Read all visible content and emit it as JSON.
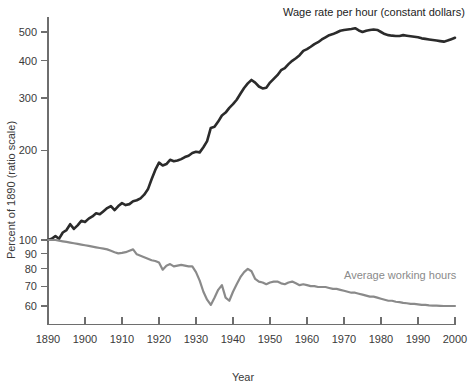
{
  "chart_data": {
    "type": "line",
    "title": "",
    "xlabel": "Year",
    "ylabel": "Percent of 1890 (ratio scale)",
    "scale": "log",
    "grid": false,
    "legend_position": "inline-annotations",
    "xlim": [
      1890,
      2000
    ],
    "ylim": [
      52,
      560
    ],
    "xticks": [
      1890,
      1900,
      1910,
      1920,
      1930,
      1940,
      1950,
      1960,
      1970,
      1980,
      1990,
      2000
    ],
    "xticklabels": [
      "1890",
      "1900",
      "1910",
      "1920",
      "1930",
      "1940",
      "1950",
      "1960",
      "1970",
      "1980",
      "1990",
      "2000"
    ],
    "yticks": [
      60,
      70,
      80,
      90,
      100,
      200,
      300,
      400,
      500
    ],
    "yticklabels": [
      "60",
      "70",
      "80",
      "90",
      "100",
      "200",
      "300",
      "400",
      "500"
    ],
    "colors": {
      "wage_rate": "#2b2b2b",
      "working_hours": "#8a8a8a",
      "axis": "#6e6e6e",
      "background": "#ffffff"
    },
    "series": [
      {
        "name": "Wage rate per hour (constant dollars)",
        "color": "#2b2b2b",
        "stroke_width": 2.6,
        "annotation": "Wage rate per hour (constant dollars)",
        "x": [
          1890,
          1891,
          1892,
          1893,
          1894,
          1895,
          1896,
          1897,
          1898,
          1899,
          1900,
          1901,
          1902,
          1903,
          1904,
          1905,
          1906,
          1907,
          1908,
          1909,
          1910,
          1911,
          1912,
          1913,
          1914,
          1915,
          1916,
          1917,
          1918,
          1919,
          1920,
          1921,
          1922,
          1923,
          1924,
          1925,
          1926,
          1927,
          1928,
          1929,
          1930,
          1931,
          1932,
          1933,
          1934,
          1935,
          1936,
          1937,
          1938,
          1939,
          1940,
          1941,
          1942,
          1943,
          1944,
          1945,
          1946,
          1947,
          1948,
          1949,
          1950,
          1951,
          1952,
          1953,
          1954,
          1955,
          1956,
          1957,
          1958,
          1959,
          1960,
          1961,
          1962,
          1963,
          1964,
          1965,
          1966,
          1967,
          1968,
          1969,
          1970,
          1971,
          1972,
          1973,
          1974,
          1975,
          1976,
          1977,
          1978,
          1979,
          1980,
          1981,
          1982,
          1983,
          1984,
          1985,
          1986,
          1987,
          1988,
          1989,
          1990,
          1991,
          1992,
          1993,
          1994,
          1995,
          1996,
          1997,
          1998,
          1999,
          2000
        ],
        "y": [
          100,
          101,
          103,
          101,
          106,
          108,
          113,
          109,
          112,
          116,
          115,
          118,
          120,
          123,
          122,
          125,
          128,
          130,
          126,
          130,
          133,
          131,
          132,
          135,
          136,
          138,
          142,
          148,
          160,
          172,
          182,
          178,
          180,
          186,
          184,
          185,
          187,
          190,
          192,
          196,
          198,
          197,
          205,
          215,
          238,
          240,
          250,
          262,
          268,
          278,
          286,
          296,
          310,
          324,
          336,
          345,
          338,
          328,
          323,
          325,
          338,
          348,
          358,
          372,
          378,
          390,
          400,
          408,
          418,
          432,
          438,
          446,
          455,
          462,
          472,
          480,
          488,
          492,
          498,
          505,
          508,
          510,
          512,
          515,
          506,
          500,
          505,
          508,
          510,
          508,
          500,
          492,
          488,
          486,
          485,
          485,
          488,
          486,
          484,
          482,
          480,
          476,
          474,
          472,
          470,
          468,
          466,
          464,
          468,
          473,
          478
        ]
      },
      {
        "name": "Average working hours",
        "color": "#8a8a8a",
        "stroke_width": 2.2,
        "annotation": "Average working hours",
        "x": [
          1890,
          1891,
          1892,
          1893,
          1894,
          1895,
          1896,
          1897,
          1898,
          1899,
          1900,
          1901,
          1902,
          1903,
          1904,
          1905,
          1906,
          1907,
          1908,
          1909,
          1910,
          1911,
          1912,
          1913,
          1914,
          1915,
          1916,
          1917,
          1918,
          1919,
          1920,
          1921,
          1922,
          1923,
          1924,
          1925,
          1926,
          1927,
          1928,
          1929,
          1930,
          1931,
          1932,
          1933,
          1934,
          1935,
          1936,
          1937,
          1938,
          1939,
          1940,
          1941,
          1942,
          1943,
          1944,
          1945,
          1946,
          1947,
          1948,
          1949,
          1950,
          1951,
          1952,
          1953,
          1954,
          1955,
          1956,
          1957,
          1958,
          1959,
          1960,
          1961,
          1962,
          1963,
          1964,
          1965,
          1966,
          1967,
          1968,
          1969,
          1970,
          1971,
          1972,
          1973,
          1974,
          1975,
          1976,
          1977,
          1978,
          1979,
          1980,
          1981,
          1982,
          1983,
          1984,
          1985,
          1986,
          1987,
          1988,
          1989,
          1990,
          1991,
          1992,
          1993,
          1994,
          1995,
          1996,
          1997,
          1998,
          1999,
          2000
        ],
        "y": [
          100,
          100,
          100,
          99.5,
          99,
          98.5,
          98,
          97.5,
          97,
          96.5,
          96,
          95.5,
          95,
          94.5,
          94,
          93.5,
          93,
          92,
          91,
          90.2,
          90.5,
          91,
          92,
          93,
          89.5,
          88.5,
          87.5,
          86.5,
          85.5,
          85,
          84,
          79.5,
          82,
          83,
          81.5,
          82,
          82.5,
          82,
          81.5,
          81.5,
          78,
          73,
          67,
          63,
          60.5,
          64,
          68,
          70.5,
          64,
          62.5,
          67,
          71,
          75,
          78,
          80,
          78.5,
          74,
          72.5,
          72,
          71,
          72,
          72.5,
          72.5,
          71.5,
          71,
          72,
          72.5,
          71.5,
          70.5,
          71,
          70.5,
          70,
          70,
          69.5,
          69.5,
          69.5,
          69,
          68.5,
          68.5,
          68,
          67.5,
          67,
          66.5,
          66.5,
          66,
          65.5,
          65,
          64.5,
          64.5,
          64,
          63.5,
          63,
          62.5,
          62.5,
          62,
          61.8,
          61.5,
          61.3,
          61,
          61,
          60.8,
          60.5,
          60.5,
          60.3,
          60.2,
          60.2,
          60.1,
          60,
          60,
          60,
          60
        ]
      }
    ]
  },
  "annotations": {
    "wage_label": "Wage rate per hour (constant dollars)",
    "hours_label": "Average working hours"
  },
  "axes": {
    "x_title": "Year",
    "y_title": "Percent of 1890 (ratio scale)"
  }
}
